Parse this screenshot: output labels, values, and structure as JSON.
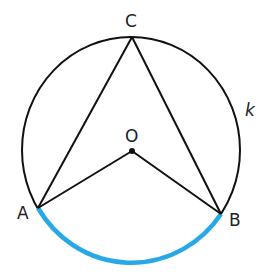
{
  "diagram": {
    "circle_label": "k",
    "points": {
      "A": "A",
      "B": "B",
      "C": "C",
      "O": "O"
    },
    "colors": {
      "stroke": "#111111",
      "arc_highlight": "#29a8e8"
    }
  }
}
